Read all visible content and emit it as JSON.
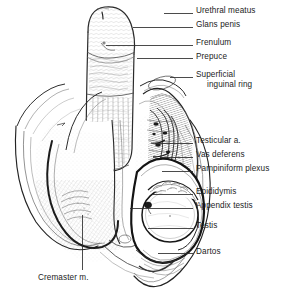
{
  "figure": {
    "background_color": "#ffffff",
    "ink_color": "#1a1a1a",
    "text_color": "#1c1c1c",
    "width": 287,
    "height": 292,
    "style": "pen-and-ink anatomical line drawing with hatching and stippling"
  },
  "labels": [
    {
      "id": "urethral-meatus",
      "text": "Urethral meatus",
      "line2": "",
      "text_x": 196,
      "text_y": 6,
      "leader": {
        "x1": 164,
        "y1": 13,
        "x2": 193,
        "y2": 13
      },
      "pointer": {
        "x": 103,
        "y": 14
      }
    },
    {
      "id": "glans-penis",
      "text": "Glans penis",
      "line2": "",
      "text_x": 196,
      "text_y": 20,
      "leader": {
        "x1": 133,
        "y1": 27,
        "x2": 193,
        "y2": 27
      },
      "pointer": {
        "x": 120,
        "y": 29
      }
    },
    {
      "id": "frenulum",
      "text": "Frenulum",
      "line2": "",
      "text_x": 196,
      "text_y": 38,
      "leader": {
        "x1": 106,
        "y1": 45,
        "x2": 193,
        "y2": 45
      },
      "pointer": {
        "x": 105,
        "y": 43
      }
    },
    {
      "id": "prepuce",
      "text": "Prepuce",
      "line2": "",
      "text_x": 196,
      "text_y": 52,
      "leader": {
        "x1": 137,
        "y1": 58,
        "x2": 193,
        "y2": 58
      },
      "pointer": {
        "x": 135,
        "y": 56
      }
    },
    {
      "id": "superficial-inguinal-ring",
      "text": "Superficial",
      "line2": "inguinal ring",
      "text_x": 196,
      "text_y": 70,
      "leader": {
        "x1": 170,
        "y1": 77,
        "x2": 193,
        "y2": 77
      },
      "pointer": {
        "x": 168,
        "y": 76
      }
    },
    {
      "id": "testicular-artery",
      "text": "Testicular a.",
      "line2": "",
      "text_x": 196,
      "text_y": 136,
      "leader": {
        "x1": 155,
        "y1": 143,
        "x2": 193,
        "y2": 143
      },
      "pointer": {
        "x": 152,
        "y": 145
      }
    },
    {
      "id": "vas-deferens",
      "text": "Vas deferens",
      "line2": "",
      "text_x": 196,
      "text_y": 150,
      "leader": {
        "x1": 160,
        "y1": 157,
        "x2": 193,
        "y2": 157
      },
      "pointer": {
        "x": 158,
        "y": 156
      }
    },
    {
      "id": "pampiniform-plexus",
      "text": "Pampiniform plexus",
      "line2": "",
      "text_x": 196,
      "text_y": 164,
      "leader": {
        "x1": 162,
        "y1": 171,
        "x2": 193,
        "y2": 171
      },
      "pointer": {
        "x": 160,
        "y": 172
      }
    },
    {
      "id": "epididymis",
      "text": "Epididymis",
      "line2": "",
      "text_x": 196,
      "text_y": 187,
      "leader": {
        "x1": 152,
        "y1": 194,
        "x2": 193,
        "y2": 194
      },
      "pointer": {
        "x": 148,
        "y": 192
      }
    },
    {
      "id": "appendix-testis",
      "text": "Appendix testis",
      "line2": "",
      "text_x": 196,
      "text_y": 201,
      "leader": {
        "x1": 130,
        "y1": 208,
        "x2": 193,
        "y2": 208
      },
      "pointer": {
        "x": 128,
        "y": 207
      }
    },
    {
      "id": "testis",
      "text": "Testis",
      "line2": "",
      "text_x": 196,
      "text_y": 221,
      "leader": {
        "x1": 148,
        "y1": 228,
        "x2": 193,
        "y2": 228
      },
      "pointer": {
        "x": 146,
        "y": 228
      }
    },
    {
      "id": "dartos",
      "text": "Dartos",
      "line2": "",
      "text_x": 196,
      "text_y": 247,
      "leader": {
        "x1": 158,
        "y1": 253,
        "x2": 193,
        "y2": 253
      },
      "pointer": {
        "x": 156,
        "y": 251
      }
    },
    {
      "id": "cremaster-muscle",
      "text": "Cremaster m.",
      "line2": "",
      "text_x": 38,
      "text_y": 273,
      "leader": {
        "x1": 82,
        "y1": 215,
        "x2": 82,
        "y2": 270
      },
      "pointer": {
        "x": 82,
        "y": 214
      }
    }
  ],
  "structures": [
    "penis shaft",
    "glans penis",
    "prepuce",
    "frenulum",
    "urethral meatus",
    "left scrotal compartment",
    "right scrotal compartment",
    "spermatic cord",
    "pampiniform plexus",
    "vas deferens",
    "testicular artery",
    "testis",
    "epididymis",
    "appendix testis",
    "dartos fascia",
    "cremaster muscle",
    "superficial inguinal ring"
  ]
}
